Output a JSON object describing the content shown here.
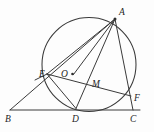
{
  "figure": {
    "type": "euclidean-geometry-diagram",
    "stroke_color": "#3a3a3a",
    "label_color": "#1d1d1d",
    "background_color": "#fdfdfd",
    "canvas": {
      "width": 154,
      "height": 132
    }
  },
  "circle": {
    "label": "O",
    "center": {
      "x": 89,
      "y": 64.5
    },
    "radius": 47
  },
  "points": [
    {
      "id": "A",
      "label": "A",
      "x": 115,
      "y": 19,
      "label_x": 119,
      "label_y": 15,
      "on_circle": true,
      "dot": true
    },
    {
      "id": "B",
      "label": "B",
      "x": 10,
      "y": 110,
      "label_x": 5,
      "label_y": 122,
      "on_circle": false,
      "dot": false
    },
    {
      "id": "C",
      "label": "C",
      "x": 133,
      "y": 110,
      "label_x": 130,
      "label_y": 122,
      "on_circle": false,
      "dot": false
    },
    {
      "id": "D",
      "label": "D",
      "x": 76,
      "y": 108.5,
      "label_x": 72,
      "label_y": 122,
      "on_circle": true,
      "dot": false
    },
    {
      "id": "E",
      "label": "E",
      "x": 47,
      "y": 74,
      "label_x": 39,
      "label_y": 77,
      "on_circle": true,
      "dot": false
    },
    {
      "id": "F",
      "label": "F",
      "x": 131,
      "y": 96,
      "label_x": 134,
      "label_y": 101,
      "on_circle": true,
      "dot": false
    },
    {
      "id": "M",
      "label": "M",
      "x": 88,
      "y": 84,
      "label_x": 92,
      "label_y": 87,
      "on_circle": false,
      "dot": false
    },
    {
      "id": "O",
      "label": "O",
      "x": 72.5,
      "y": 74,
      "label_x": 61,
      "label_y": 77,
      "on_circle": false,
      "dot": true
    }
  ],
  "segments": [
    {
      "id": "BC",
      "name": "base-line-b-c",
      "x1": 10,
      "y1": 110,
      "x2": 140,
      "y2": 110
    },
    {
      "id": "BA",
      "name": "line-b-e-a",
      "x1": 10,
      "y1": 110,
      "x2": 115,
      "y2": 19
    },
    {
      "id": "AC",
      "name": "line-a-f-c",
      "x1": 115,
      "y1": 19,
      "x2": 133,
      "y2": 110
    },
    {
      "id": "AD",
      "name": "line-a-m-d",
      "x1": 115,
      "y1": 19,
      "x2": 76,
      "y2": 108.5
    },
    {
      "id": "AO",
      "name": "line-a-o-dot",
      "x1": 115,
      "y1": 19,
      "x2": 73.5,
      "y2": 74.5
    },
    {
      "id": "AE",
      "name": "line-a-e",
      "x1": 115,
      "y1": 19,
      "x2": 47,
      "y2": 74
    },
    {
      "id": "EF",
      "name": "line-e-m-f",
      "x1": 47,
      "y1": 74,
      "x2": 131,
      "y2": 96
    },
    {
      "id": "ED",
      "name": "line-e-d",
      "x1": 47,
      "y1": 74,
      "x2": 76,
      "y2": 108.5
    },
    {
      "id": "EL",
      "name": "line-e-extend-left",
      "x1": 47,
      "y1": 74,
      "x2": 35,
      "y2": 80
    }
  ],
  "labels": {
    "A": "A",
    "B": "B",
    "C": "C",
    "D": "D",
    "E": "E",
    "F": "F",
    "M": "M",
    "O": "O"
  }
}
